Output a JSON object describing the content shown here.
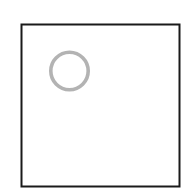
{
  "diagram": {
    "square": {
      "x": 21.5,
      "y": 24.5,
      "width": 158,
      "height": 162,
      "stroke": "#1a1a1a",
      "stroke_width": 2
    },
    "circle": {
      "cx": 69.5,
      "cy": 71,
      "r": 18.7,
      "stroke": "#b3b3b3",
      "stroke_width": 3.6
    }
  }
}
